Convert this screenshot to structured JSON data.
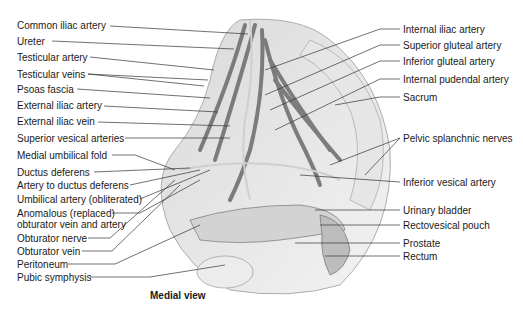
{
  "figure": {
    "caption": "Medial view",
    "left_labels": [
      {
        "text": "Common iliac artery",
        "x": 17,
        "y": 20
      },
      {
        "text": "Ureter",
        "x": 17,
        "y": 36
      },
      {
        "text": "Testicular artery",
        "x": 17,
        "y": 52
      },
      {
        "text": "Testicular veins",
        "x": 17,
        "y": 69
      },
      {
        "text": "Psoas fascia",
        "x": 17,
        "y": 84
      },
      {
        "text": "External iliac artery",
        "x": 17,
        "y": 100
      },
      {
        "text": "External iliac vein",
        "x": 17,
        "y": 116
      },
      {
        "text": "Superior vesical arteries",
        "x": 17,
        "y": 133
      },
      {
        "text": "Medial umbilical fold",
        "x": 17,
        "y": 150
      },
      {
        "text": "Ductus deferens",
        "x": 17,
        "y": 167
      },
      {
        "text": "Artery to ductus deferens",
        "x": 17,
        "y": 180
      },
      {
        "text": "Umbilical artery (obliterated)",
        "x": 17,
        "y": 194
      },
      {
        "text": "Anomalous (replaced)",
        "x": 17,
        "y": 208
      },
      {
        "text": "obturator vein and artery",
        "x": 17,
        "y": 219
      },
      {
        "text": "Obturator nerve",
        "x": 17,
        "y": 233
      },
      {
        "text": "Obturator vein",
        "x": 17,
        "y": 246
      },
      {
        "text": "Peritoneum",
        "x": 17,
        "y": 259
      },
      {
        "text": "Pubic symphysis",
        "x": 17,
        "y": 272
      }
    ],
    "right_labels": [
      {
        "text": "Internal iliac artery",
        "x": 403,
        "y": 24
      },
      {
        "text": "Superior gluteal artery",
        "x": 403,
        "y": 40
      },
      {
        "text": "Inferior gluteal artery",
        "x": 403,
        "y": 56
      },
      {
        "text": "Internal pudendal artery",
        "x": 403,
        "y": 74
      },
      {
        "text": "Sacrum",
        "x": 403,
        "y": 92
      },
      {
        "text": "Pelvic splanchnic nerves",
        "x": 403,
        "y": 133
      },
      {
        "text": "Inferior vesical artery",
        "x": 403,
        "y": 177
      },
      {
        "text": "Urinary bladder",
        "x": 403,
        "y": 205
      },
      {
        "text": "Rectovesical pouch",
        "x": 403,
        "y": 220
      },
      {
        "text": "Prostate",
        "x": 403,
        "y": 238
      },
      {
        "text": "Rectum",
        "x": 403,
        "y": 251
      }
    ]
  }
}
